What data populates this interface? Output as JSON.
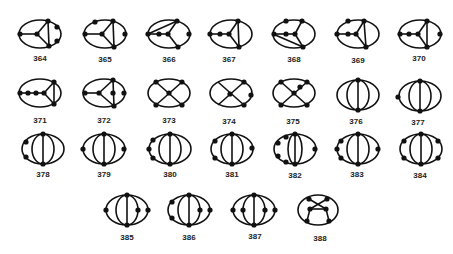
{
  "figure": {
    "stroke_color": "#111111",
    "background": "#ffffff"
  },
  "graphs": [
    {
      "id": "364",
      "label": "364",
      "cx": 40,
      "cy": 34,
      "row": 1
    },
    {
      "id": "365",
      "label": "365",
      "cx": 105,
      "cy": 34,
      "row": 1
    },
    {
      "id": "366",
      "label": "366",
      "cx": 169,
      "cy": 34,
      "row": 1
    },
    {
      "id": "367",
      "label": "367",
      "cx": 231,
      "cy": 34,
      "row": 1
    },
    {
      "id": "368",
      "label": "368",
      "cx": 294,
      "cy": 34,
      "row": 1
    },
    {
      "id": "369",
      "label": "369",
      "cx": 358,
      "cy": 34,
      "row": 1
    },
    {
      "id": "370",
      "label": "370",
      "cx": 420,
      "cy": 34,
      "row": 1
    },
    {
      "id": "371",
      "label": "371",
      "cx": 40,
      "cy": 96,
      "row": 2
    },
    {
      "id": "372",
      "label": "372",
      "cx": 104,
      "cy": 96,
      "row": 2
    },
    {
      "id": "373",
      "label": "373",
      "cx": 169,
      "cy": 96,
      "row": 2
    },
    {
      "id": "374",
      "label": "374",
      "cx": 231,
      "cy": 96,
      "row": 2
    },
    {
      "id": "375",
      "label": "375",
      "cx": 294,
      "cy": 96,
      "row": 2
    },
    {
      "id": "376",
      "label": "376",
      "cx": 358,
      "cy": 96,
      "row": 2
    },
    {
      "id": "377",
      "label": "377",
      "cx": 420,
      "cy": 96,
      "row": 2
    },
    {
      "id": "378",
      "label": "378",
      "cx": 40,
      "cy": 150,
      "row": 3
    },
    {
      "id": "379",
      "label": "379",
      "cx": 104,
      "cy": 150,
      "row": 3
    },
    {
      "id": "380",
      "label": "380",
      "cx": 169,
      "cy": 150,
      "row": 3
    },
    {
      "id": "381",
      "label": "381",
      "cx": 231,
      "cy": 150,
      "row": 3
    },
    {
      "id": "382",
      "label": "382",
      "cx": 294,
      "cy": 150,
      "row": 3
    },
    {
      "id": "383",
      "label": "383",
      "cx": 358,
      "cy": 150,
      "row": 3
    },
    {
      "id": "384",
      "label": "384",
      "cx": 420,
      "cy": 150,
      "row": 3
    },
    {
      "id": "385",
      "label": "385",
      "cx": 127,
      "cy": 210,
      "row": 4
    },
    {
      "id": "386",
      "label": "386",
      "cx": 189,
      "cy": 210,
      "row": 4
    },
    {
      "id": "387",
      "label": "387",
      "cx": 253,
      "cy": 210,
      "row": 4
    },
    {
      "id": "388",
      "label": "388",
      "cx": 318,
      "cy": 210,
      "row": 4
    }
  ]
}
